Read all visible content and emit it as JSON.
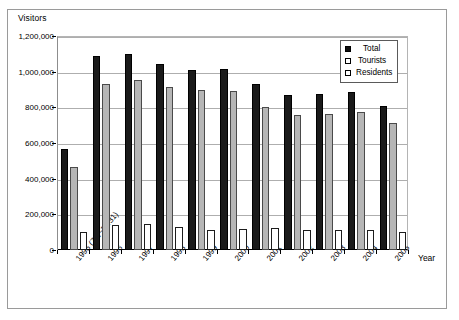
{
  "chart_data": {
    "type": "bar",
    "title": "",
    "subtitle": "",
    "xlabel": "Year",
    "ylabel": "Visitors",
    "ylim": [
      0,
      1200000
    ],
    "ytick_labels": [
      "1,200,000",
      "1,000,000",
      "800,000",
      "600,000",
      "400,000",
      "200,000",
      "0"
    ],
    "ytick_values": [
      1200000,
      1000000,
      800000,
      600000,
      400000,
      200000,
      0
    ],
    "grid": true,
    "legend_position": "top-right",
    "categories": [
      "1995 (7/1~12/31)",
      "1996",
      "1997",
      "1998",
      "1999",
      "2000",
      "2001",
      "2002",
      "2003",
      "2004",
      "2005"
    ],
    "series": [
      {
        "name": "Total",
        "color": "#1a1a1a",
        "values": [
          565000,
          1090000,
          1100000,
          1045000,
          1010000,
          1015000,
          930000,
          870000,
          875000,
          885000,
          805000
        ]
      },
      {
        "name": "Tourists",
        "color": "#b6b6b6",
        "values": [
          465000,
          930000,
          955000,
          915000,
          895000,
          890000,
          800000,
          755000,
          760000,
          775000,
          710000
        ]
      },
      {
        "name": "Residents",
        "color": "#ffffff",
        "values": [
          100000,
          140000,
          145000,
          130000,
          115000,
          120000,
          125000,
          115000,
          115000,
          110000,
          100000
        ]
      }
    ]
  },
  "legend": {
    "items": [
      {
        "label": "Total",
        "marker": "filled-square"
      },
      {
        "label": "Tourists",
        "marker": "open-square"
      },
      {
        "label": "Residents",
        "marker": "open-square"
      }
    ]
  },
  "axes": {
    "y_title": "Visitors",
    "x_title": "Year"
  }
}
